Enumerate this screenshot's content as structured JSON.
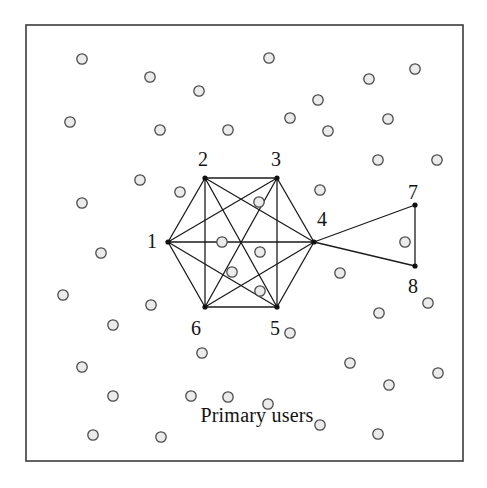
{
  "figure": {
    "caption_label": "Primary users",
    "frame": {
      "x": 26,
      "y": 25,
      "width": 437,
      "height": 436,
      "stroke": "#3b3b3b",
      "stroke_width": 1.6,
      "fill": "#ffffff"
    },
    "style": {
      "edge_color": "#1c1c1c",
      "edge_width": 1.3,
      "node_dot_color": "#111111",
      "node_dot_radius": 2.6,
      "circle_stroke": "#4a4a4a",
      "circle_fill": "#ebebeb",
      "circle_radius": 5.2,
      "circle_stroke_width": 1.3,
      "label_color": "#141414",
      "background": "#ffffff"
    }
  },
  "graph": {
    "nodes": [
      {
        "id": "1",
        "label": "1",
        "x": 168,
        "y": 242,
        "label_x": 152,
        "label_y": 241
      },
      {
        "id": "2",
        "label": "2",
        "x": 205,
        "y": 178,
        "label_x": 203,
        "label_y": 159
      },
      {
        "id": "3",
        "label": "3",
        "x": 277,
        "y": 178,
        "label_x": 276,
        "label_y": 159
      },
      {
        "id": "4",
        "label": "4",
        "x": 314,
        "y": 242,
        "label_x": 322,
        "label_y": 219
      },
      {
        "id": "5",
        "label": "5",
        "x": 277,
        "y": 307,
        "label_x": 275,
        "label_y": 328
      },
      {
        "id": "6",
        "label": "6",
        "x": 205,
        "y": 307,
        "label_x": 196,
        "label_y": 328
      },
      {
        "id": "7",
        "label": "7",
        "x": 415,
        "y": 205,
        "label_x": 413,
        "label_y": 192
      },
      {
        "id": "8",
        "label": "8",
        "x": 415,
        "y": 266,
        "label_x": 413,
        "label_y": 286
      }
    ],
    "edges": [
      [
        "1",
        "2"
      ],
      [
        "1",
        "3"
      ],
      [
        "1",
        "4"
      ],
      [
        "1",
        "5"
      ],
      [
        "1",
        "6"
      ],
      [
        "2",
        "3"
      ],
      [
        "2",
        "4"
      ],
      [
        "2",
        "5"
      ],
      [
        "2",
        "6"
      ],
      [
        "3",
        "4"
      ],
      [
        "3",
        "5"
      ],
      [
        "3",
        "6"
      ],
      [
        "4",
        "5"
      ],
      [
        "4",
        "6"
      ],
      [
        "5",
        "6"
      ],
      [
        "4",
        "7"
      ],
      [
        "4",
        "8"
      ],
      [
        "7",
        "8"
      ]
    ]
  },
  "primary_users": {
    "count": 46,
    "points": [
      [
        82,
        59
      ],
      [
        269,
        58
      ],
      [
        415,
        69
      ],
      [
        150,
        77
      ],
      [
        369,
        79
      ],
      [
        70,
        122
      ],
      [
        318,
        100
      ],
      [
        160,
        130
      ],
      [
        290,
        118
      ],
      [
        388,
        119
      ],
      [
        228,
        130
      ],
      [
        199,
        91
      ],
      [
        328,
        131
      ],
      [
        378,
        160
      ],
      [
        437,
        160
      ],
      [
        140,
        180
      ],
      [
        180,
        192
      ],
      [
        320,
        190
      ],
      [
        82,
        203
      ],
      [
        259,
        202
      ],
      [
        222,
        242
      ],
      [
        260,
        252
      ],
      [
        232,
        272
      ],
      [
        260,
        291
      ],
      [
        340,
        273
      ],
      [
        101,
        253
      ],
      [
        63,
        295
      ],
      [
        151,
        305
      ],
      [
        428,
        303
      ],
      [
        113,
        325
      ],
      [
        379,
        313
      ],
      [
        405,
        242
      ],
      [
        82,
        367
      ],
      [
        202,
        353
      ],
      [
        350,
        363
      ],
      [
        438,
        373
      ],
      [
        113,
        396
      ],
      [
        191,
        396
      ],
      [
        228,
        397
      ],
      [
        290,
        333
      ],
      [
        389,
        385
      ],
      [
        320,
        425
      ],
      [
        93,
        435
      ],
      [
        161,
        437
      ],
      [
        378,
        434
      ],
      [
        268,
        404
      ]
    ]
  },
  "caption": {
    "x": 257,
    "y": 415,
    "text": "Primary users"
  }
}
